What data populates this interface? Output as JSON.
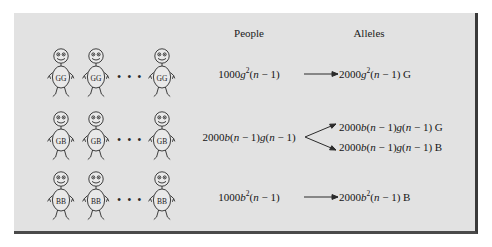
{
  "figure": {
    "panel_bg": "#e2e2e2",
    "border_color": "#3a3a3a",
    "text_color": "#151515"
  },
  "headers": {
    "people": "People",
    "alleles": "Alleles"
  },
  "ellipsis": "• • •",
  "rows": [
    {
      "genotype": "GG",
      "figure_count": 3,
      "people_formula_html": "1000<i>g</i><sup>2</sup>(<i>n</i> &minus; 1)",
      "arrow_type": "single",
      "alleles": [
        "2000<i>g</i><sup>2</sup>(<i>n</i> &minus; 1) G"
      ]
    },
    {
      "genotype": "GB",
      "figure_count": 3,
      "people_formula_html": "2000<i>b</i>(<i>n</i> &minus; 1)<i>g</i>(<i>n</i> &minus; 1)",
      "arrow_type": "branch",
      "alleles": [
        "2000<i>b</i>(<i>n</i> &minus; 1)<i>g</i>(<i>n</i> &minus; 1) G",
        "2000<i>b</i>(<i>n</i> &minus; 1)<i>g</i>(<i>n</i> &minus; 1) B"
      ]
    },
    {
      "genotype": "BB",
      "figure_count": 3,
      "people_formula_html": "1000<i>b</i><sup>2</sup>(<i>n</i> &minus; 1)",
      "arrow_type": "single",
      "alleles": [
        "2000<i>b</i><sup>2</sup>(<i>n</i> &minus; 1) B"
      ]
    }
  ]
}
